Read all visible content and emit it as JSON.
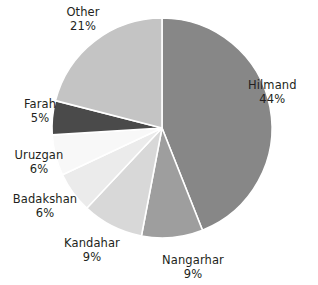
{
  "chart_data": {
    "type": "pie",
    "title": "",
    "subtitle": "",
    "xlabel": "",
    "ylabel": "",
    "legend_position": "none",
    "grid": false,
    "labels_show_percent": true,
    "total_percent": 100,
    "categories": [
      "Hilmand",
      "Nangarhar",
      "Kandahar",
      "Badakshan",
      "Uruzgan",
      "Farah",
      "Other"
    ],
    "values": [
      44,
      9,
      9,
      6,
      6,
      5,
      21
    ],
    "value_suffix": "%",
    "slices": [
      {
        "name": "Hilmand",
        "value": 44,
        "value_text": "44%",
        "color": "#878787",
        "start_deg": 0,
        "end_deg": 158.4
      },
      {
        "name": "Nangarhar",
        "value": 9,
        "value_text": "9%",
        "color": "#9e9e9e",
        "start_deg": 158.4,
        "end_deg": 190.8
      },
      {
        "name": "Kandahar",
        "value": 9,
        "value_text": "9%",
        "color": "#d8d8d8",
        "start_deg": 190.8,
        "end_deg": 223.2
      },
      {
        "name": "Badakshan",
        "value": 6,
        "value_text": "6%",
        "color": "#ebebeb",
        "start_deg": 223.2,
        "end_deg": 244.8
      },
      {
        "name": "Uruzgan",
        "value": 6,
        "value_text": "6%",
        "color": "#f8f8f8",
        "start_deg": 244.8,
        "end_deg": 266.4
      },
      {
        "name": "Farah",
        "value": 5,
        "value_text": "5%",
        "color": "#4a4a4a",
        "start_deg": 266.4,
        "end_deg": 284.4
      },
      {
        "name": "Other",
        "value": 21,
        "value_text": "21%",
        "color": "#c4c4c4",
        "start_deg": 284.4,
        "end_deg": 360
      }
    ],
    "colors": [
      "#878787",
      "#9e9e9e",
      "#d8d8d8",
      "#ebebeb",
      "#f8f8f8",
      "#4a4a4a",
      "#c4c4c4"
    ],
    "background_color": "#ffffff",
    "slice_separator_color": "#ffffff"
  },
  "labels": {
    "hilmand": {
      "name": "Hilmand",
      "value": "44%"
    },
    "nangarhar": {
      "name": "Nangarhar",
      "value": "9%"
    },
    "kandahar": {
      "name": "Kandahar",
      "value": "9%"
    },
    "badakshan": {
      "name": "Badakshan",
      "value": "6%"
    },
    "uruzgan": {
      "name": "Uruzgan",
      "value": "6%"
    },
    "farah": {
      "name": "Farah",
      "value": "5%"
    },
    "other": {
      "name": "Other",
      "value": "21%"
    }
  }
}
